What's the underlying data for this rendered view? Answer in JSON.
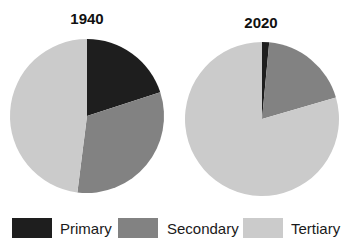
{
  "chart_data": [
    {
      "type": "pie",
      "title": "1940",
      "categories": [
        "Primary",
        "Secondary",
        "Tertiary"
      ],
      "values": [
        20,
        32,
        48
      ],
      "colors": [
        "#1e1e1e",
        "#828282",
        "#cbcbcb"
      ],
      "start_angle": "12 o'clock, clockwise"
    },
    {
      "type": "pie",
      "title": "2020",
      "categories": [
        "Primary",
        "Secondary",
        "Tertiary"
      ],
      "values": [
        1.5,
        19,
        79.5
      ],
      "colors": [
        "#1e1e1e",
        "#828282",
        "#cbcbcb"
      ],
      "start_angle": "12 o'clock, clockwise"
    }
  ],
  "legend": [
    {
      "label": "Primary",
      "color": "#1e1e1e"
    },
    {
      "label": "Secondary",
      "color": "#828282"
    },
    {
      "label": "Tertiary",
      "color": "#cbcbcb"
    }
  ]
}
